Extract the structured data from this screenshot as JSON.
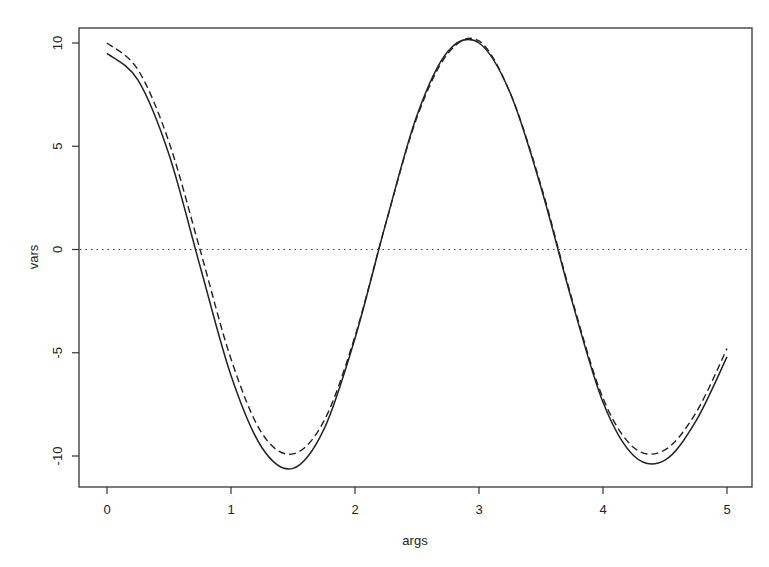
{
  "chart_data": {
    "type": "line",
    "title": "",
    "xlabel": "args",
    "ylabel": "vars",
    "xlim": [
      -0.1,
      5.1
    ],
    "ylim": [
      -11.5,
      10.7
    ],
    "grid": false,
    "legend": null,
    "xticks": [
      0,
      1,
      2,
      3,
      4,
      5
    ],
    "yticks": [
      -10,
      -5,
      0,
      5,
      10
    ],
    "xtick_labels": [
      "0",
      "1",
      "2",
      "3",
      "4",
      "5"
    ],
    "ytick_labels": [
      "-10",
      "-5",
      "0",
      "5",
      "10"
    ],
    "reference_lines": [
      {
        "type": "horizontal",
        "y": 0,
        "style": "dotted"
      }
    ],
    "x": [
      0,
      0.25,
      0.5,
      0.75,
      1.0,
      1.25,
      1.5,
      1.75,
      2.0,
      2.25,
      2.5,
      2.75,
      3.0,
      3.25,
      3.5,
      3.75,
      4.0,
      4.25,
      4.5,
      4.75,
      5.0
    ],
    "series": [
      {
        "name": "solid",
        "style": "solid",
        "values": [
          9.5,
          8.2,
          4.6,
          -0.8,
          -6.1,
          -9.6,
          -10.6,
          -8.7,
          -4.3,
          1.3,
          6.5,
          9.6,
          10.0,
          7.6,
          3.0,
          -2.5,
          -7.4,
          -10.0,
          -10.2,
          -8.3,
          -5.2
        ]
      },
      {
        "name": "dashed",
        "style": "dashed",
        "values": [
          10.0,
          8.7,
          5.2,
          0.0,
          -5.3,
          -8.9,
          -9.9,
          -8.3,
          -4.2,
          1.3,
          6.4,
          9.5,
          10.1,
          7.6,
          3.1,
          -2.4,
          -7.2,
          -9.6,
          -9.7,
          -7.9,
          -4.8
        ]
      }
    ]
  }
}
